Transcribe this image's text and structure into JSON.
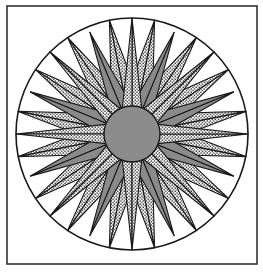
{
  "frame": {
    "x": 7,
    "y": 6,
    "width": 250,
    "height": 258,
    "stroke": "#333333",
    "stroke_width": 1.6
  },
  "compass": {
    "cx": 132,
    "cy": 134,
    "outer_radius": 116,
    "center_radius": 28,
    "colors": {
      "background": "#ffffff",
      "gray": "#8a8a8a",
      "dotted_base": "#ffffff",
      "dot": "#2a2a2a",
      "stroke": "#1a1a1a",
      "center": "#8c8c8c"
    },
    "main_points": {
      "count": 8,
      "start_angle": 0,
      "tip_radius": 116,
      "base_radius": 26,
      "half_width_deg": 22.5,
      "fill": "dotted"
    },
    "secondary_points": {
      "count": 8,
      "start_angle": 22.5,
      "tip_radius": 110,
      "base_radius": 40,
      "half_width_deg": 13,
      "fill": "gray"
    },
    "small_points": {
      "count": 16,
      "start_angle": 11.25,
      "tip_radius": 116,
      "base_radius": 66,
      "half_width_deg": 7.5,
      "fill": "dotted"
    }
  }
}
